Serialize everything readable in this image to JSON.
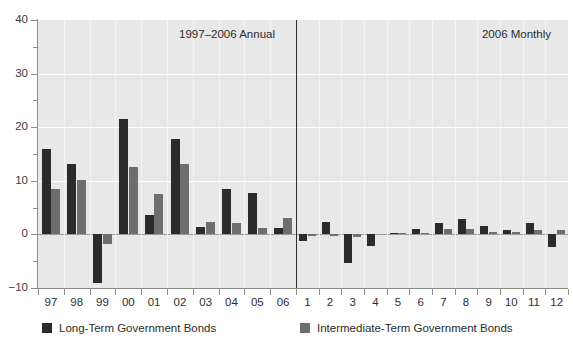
{
  "chart_data": {
    "type": "bar",
    "title": "",
    "panels": [
      {
        "id": "annual",
        "label": "1997–2006 Annual"
      },
      {
        "id": "monthly",
        "label": "2006 Monthly"
      }
    ],
    "xlabel": "",
    "ylabel": "",
    "ylim": [
      -10,
      40
    ],
    "yticks": [
      40,
      30,
      20,
      10,
      0,
      -10
    ],
    "ytick_labels": [
      "40",
      "30",
      "20",
      "10",
      "0",
      "−10"
    ],
    "y_minor_ticks": [
      35,
      25,
      15,
      5,
      -5
    ],
    "grid": true,
    "legend_position": "bottom",
    "legend": [
      {
        "name": "Long-Term Government Bonds",
        "color": "#2b2b2b"
      },
      {
        "name": "Intermediate-Term Government Bonds",
        "color": "#6e6e6e"
      }
    ],
    "annual": {
      "categories": [
        "97",
        "98",
        "99",
        "00",
        "01",
        "02",
        "03",
        "04",
        "05",
        "06"
      ],
      "series": [
        {
          "name": "Long-Term Government Bonds",
          "color": "#2b2b2b",
          "values": [
            15.9,
            13.1,
            -9.0,
            21.5,
            3.7,
            17.8,
            1.4,
            8.5,
            7.8,
            1.2
          ]
        },
        {
          "name": "Intermediate-Term Government Bonds",
          "color": "#6e6e6e",
          "values": [
            8.4,
            10.2,
            -1.8,
            12.6,
            7.6,
            13.1,
            2.4,
            2.2,
            1.2,
            3.0
          ]
        }
      ]
    },
    "monthly": {
      "categories": [
        "1",
        "2",
        "3",
        "4",
        "5",
        "6",
        "7",
        "8",
        "9",
        "10",
        "11",
        "12"
      ],
      "series": [
        {
          "name": "Long-Term Government Bonds",
          "color": "#2b2b2b",
          "values": [
            -1.2,
            2.3,
            -5.4,
            -2.2,
            0.3,
            1.0,
            2.2,
            2.9,
            1.5,
            0.8,
            2.2,
            -2.4
          ]
        },
        {
          "name": "Intermediate-Term Government Bonds",
          "color": "#6e6e6e",
          "values": [
            -0.3,
            -0.3,
            -0.5,
            0.0,
            0.2,
            0.2,
            1.0,
            1.0,
            0.4,
            0.5,
            0.9,
            0.8
          ]
        }
      ]
    }
  },
  "colors": {
    "long_term": "#2b2b2b",
    "intermediate_term": "#6e6e6e",
    "plot_background": "#e8e8e8",
    "gridline": "#ffffff",
    "axis": "#8c8c8c",
    "divider": "#2f2f2f"
  }
}
